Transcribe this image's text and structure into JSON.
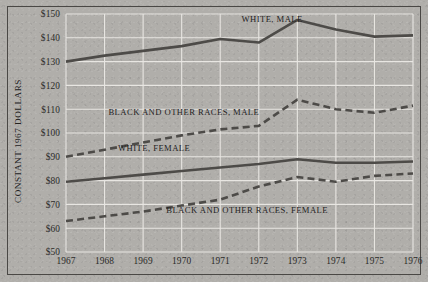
{
  "chart_data": {
    "type": "line",
    "title": "",
    "xlabel": "",
    "ylabel": "CONSTANT 1967 DOLLARS",
    "x": [
      1967,
      1968,
      1969,
      1970,
      1971,
      1972,
      1973,
      1974,
      1975,
      1976
    ],
    "xtick_labels": [
      "1967",
      "1968",
      "1969",
      "1970",
      "1971",
      "1972",
      "1973",
      "1974",
      "1975",
      "1976"
    ],
    "ytick_labels": [
      "$150",
      "$140",
      "$130",
      "$120",
      "$110",
      "$100",
      "$90",
      "$80",
      "$70",
      "$60",
      "$50"
    ],
    "ytick_values": [
      150,
      140,
      130,
      120,
      110,
      100,
      90,
      80,
      70,
      60,
      50
    ],
    "ylim": [
      50,
      150
    ],
    "xlim": [
      1967,
      1976
    ],
    "grid": true,
    "legend_position": "inline-annotations",
    "series": [
      {
        "name": "WHITE, MALE",
        "style": "solid",
        "color": "#4d4b48",
        "values": [
          130.0,
          132.5,
          134.5,
          136.5,
          139.5,
          138.0,
          147.5,
          143.5,
          140.5,
          141.0
        ]
      },
      {
        "name": "BLACK AND OTHER RACES, MALE",
        "style": "dashed",
        "color": "#4d4b48",
        "values": [
          90.0,
          93.0,
          96.0,
          99.0,
          101.5,
          103.0,
          114.0,
          110.0,
          108.5,
          111.5
        ]
      },
      {
        "name": "WHITE, FEMALE",
        "style": "solid",
        "color": "#4d4b48",
        "values": [
          79.5,
          81.0,
          82.5,
          84.0,
          85.5,
          87.0,
          89.0,
          87.5,
          87.5,
          88.0
        ]
      },
      {
        "name": "BLACK AND OTHER RACES, FEMALE",
        "style": "dashed",
        "color": "#4d4b48",
        "values": [
          63.0,
          65.0,
          67.0,
          69.5,
          72.0,
          77.5,
          81.5,
          79.5,
          82.0,
          83.0
        ]
      }
    ],
    "annotations": [
      {
        "text": "WHITE, MALE",
        "x": 1971.55,
        "y": 146.5
      },
      {
        "text": "BLACK AND OTHER RACES, MALE",
        "x": 1968.1,
        "y": 107.5
      },
      {
        "text": "WHITE, FEMALE",
        "x": 1968.35,
        "y": 92.5
      },
      {
        "text": "BLACK AND OTHER RACES, FEMALE",
        "x": 1969.6,
        "y": 66.5
      }
    ]
  }
}
